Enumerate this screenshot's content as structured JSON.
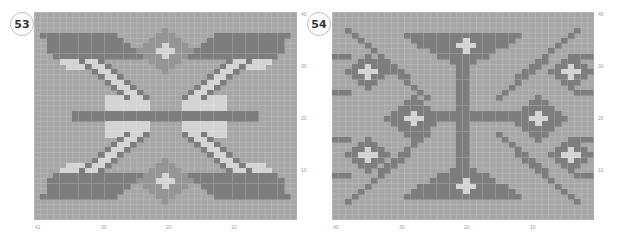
{
  "colors": {
    "background": "#a6a6a6",
    "dark": "#7d7d7d",
    "mid": "#959595",
    "light": "#d4d4d4"
  },
  "charts": [
    {
      "id": "53",
      "badge": "53",
      "cols": 41,
      "rows": 40,
      "x_ticks": [
        "41",
        "30",
        "20",
        "10"
      ],
      "y_ticks": [
        "40",
        "30",
        "20",
        "10"
      ]
    },
    {
      "id": "54",
      "badge": "54",
      "cols": 40,
      "rows": 40,
      "x_ticks": [
        "40",
        "30",
        "20",
        "10"
      ],
      "y_ticks": [
        "40",
        "30",
        "20",
        "10"
      ]
    }
  ]
}
